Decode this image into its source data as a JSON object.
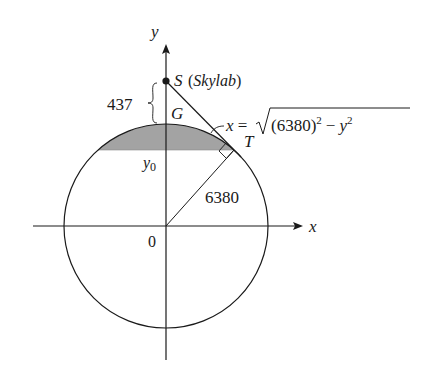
{
  "diagram": {
    "labels": {
      "y_axis": "y",
      "x_axis": "x",
      "origin": "0",
      "satellite_point": "S",
      "satellite_name": "(Skylab)",
      "altitude": "437",
      "ground_point": "G",
      "tangent_point": "T",
      "cap_level": "y",
      "cap_level_sub": "0",
      "radius": "6380",
      "equation_lhs": "x =",
      "equation_base": "(6380)",
      "equation_exp1": "2",
      "equation_minus": "−",
      "equation_var": "y",
      "equation_exp2": "2"
    },
    "geometry": {
      "circle_center": [
        166,
        226
      ],
      "circle_radius": 102,
      "satellite": [
        166,
        81
      ],
      "tangent_point": [
        234,
        150
      ],
      "cap_line_y": 150
    },
    "colors": {
      "stroke": "#1a1a1a",
      "cap_fill": "#a3a3a3",
      "background": "#ffffff"
    }
  }
}
